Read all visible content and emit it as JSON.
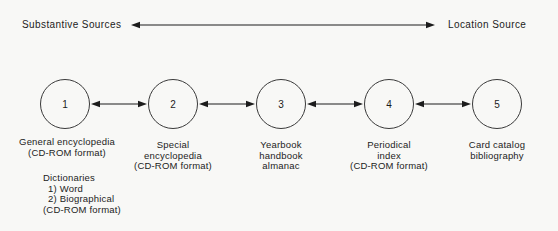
{
  "header": {
    "left_label": "Substantive Sources",
    "right_label": "Location Source"
  },
  "nodes": [
    {
      "number": "1",
      "label_lines": [
        "General encyclopedia",
        "(CD-ROM format)"
      ]
    },
    {
      "number": "2",
      "label_lines": [
        "Special",
        "encyclopedia",
        "(CD-ROM format)"
      ]
    },
    {
      "number": "3",
      "label_lines": [
        "Yearbook",
        "handbook",
        "almanac"
      ]
    },
    {
      "number": "4",
      "label_lines": [
        "Periodical",
        "index",
        "(CD-ROM format)"
      ]
    },
    {
      "number": "5",
      "label_lines": [
        "Card catalog",
        "bibliography"
      ]
    }
  ],
  "extra": {
    "lines": [
      "Dictionaries",
      "1) Word",
      "2) Biographical",
      "(CD-ROM format)"
    ]
  },
  "icons": {
    "spectrum_arrow": "double-headed-arrow",
    "connector_arrow": "double-headed-arrow"
  },
  "colors": {
    "ink": "#1c1c1c",
    "circle_border": "#3a3a3a",
    "background": "#f8f8f6"
  }
}
